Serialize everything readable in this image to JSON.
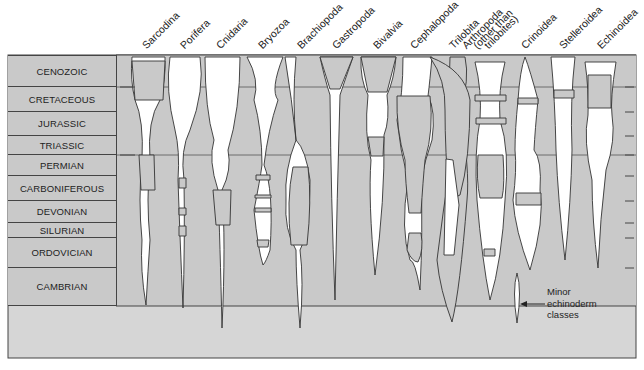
{
  "diagram": {
    "title": "",
    "taxa": [
      {
        "name": "Sarcodina",
        "label": "Sarcodina"
      },
      {
        "name": "Porifera",
        "label": "Porifera"
      },
      {
        "name": "Cnidaria",
        "label": "Cnidaria"
      },
      {
        "name": "Bryozoa",
        "label": "Bryozoa"
      },
      {
        "name": "Brachiopoda",
        "label": "Brachiopoda"
      },
      {
        "name": "Gastropoda",
        "label": "Gastropoda"
      },
      {
        "name": "Bivalvia",
        "label": "Bivalvia"
      },
      {
        "name": "Cephalopoda",
        "label": "Cephalopoda"
      },
      {
        "name": "Trilobita",
        "label": "Trilobita"
      },
      {
        "name": "Arthropoda",
        "label": "Arthropoda",
        "label2": "(other than",
        "label3": "trilobites)"
      },
      {
        "name": "Crinoidea",
        "label": "Crinoidea"
      },
      {
        "name": "Stelleroidea",
        "label": "Stelleroidea"
      },
      {
        "name": "Echinoidea",
        "label": "Echinoidea"
      }
    ],
    "periods": [
      {
        "label": "CENOZOIC"
      },
      {
        "label": "CRETACEOUS"
      },
      {
        "label": "JURASSIC"
      },
      {
        "label": "TRIASSIC"
      },
      {
        "label": "PERMIAN"
      },
      {
        "label": "CARBONIFEROUS"
      },
      {
        "label": "DEVONIAN"
      },
      {
        "label": "SILURIAN"
      },
      {
        "label": "ORDOVICIAN"
      },
      {
        "label": "CAMBRIAN"
      }
    ],
    "annotation": {
      "line1": "Minor",
      "line2": "echinoderm",
      "line3": "classes"
    },
    "colors": {
      "background_fill": "#c9c9c9",
      "lower_fill": "#d6d6d6",
      "shape_fill_white": "#ffffff",
      "outline": "#333333"
    }
  }
}
